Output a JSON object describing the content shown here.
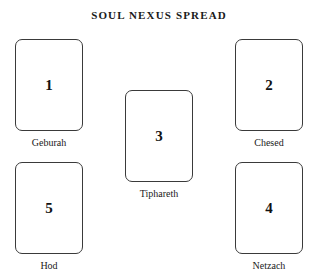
{
  "title": "SOUL NEXUS SPREAD",
  "background_color": "#ffffff",
  "card_border_color": "#3a3a3a",
  "text_color": "#1a1a1a",
  "cards": [
    {
      "position": 1,
      "number": "1",
      "label": "Geburah",
      "x": 15,
      "y": 39,
      "width": 68,
      "height": 92
    },
    {
      "position": 2,
      "number": "2",
      "label": "Chesed",
      "x": 235,
      "y": 39,
      "width": 68,
      "height": 92
    },
    {
      "position": 3,
      "number": "3",
      "label": "Tiphareth",
      "x": 125,
      "y": 90,
      "width": 68,
      "height": 92
    },
    {
      "position": 4,
      "number": "4",
      "label": "Netzach",
      "x": 235,
      "y": 162,
      "width": 68,
      "height": 92
    },
    {
      "position": 5,
      "number": "5",
      "label": "Hod",
      "x": 15,
      "y": 162,
      "width": 68,
      "height": 92
    }
  ]
}
